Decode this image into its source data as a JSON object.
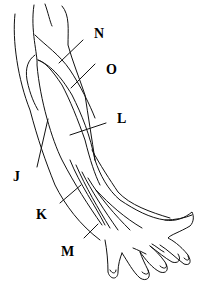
{
  "diagram": {
    "labels": [
      {
        "id": "N",
        "text": "N",
        "x": 94,
        "y": 38
      },
      {
        "id": "O",
        "text": "O",
        "x": 106,
        "y": 74
      },
      {
        "id": "L",
        "text": "L",
        "x": 117,
        "y": 123
      },
      {
        "id": "J",
        "text": "J",
        "x": 13,
        "y": 181
      },
      {
        "id": "K",
        "text": "K",
        "x": 36,
        "y": 219
      },
      {
        "id": "M",
        "text": "M",
        "x": 61,
        "y": 256
      }
    ],
    "stroke_color": "#111111",
    "background": "#ffffff"
  }
}
